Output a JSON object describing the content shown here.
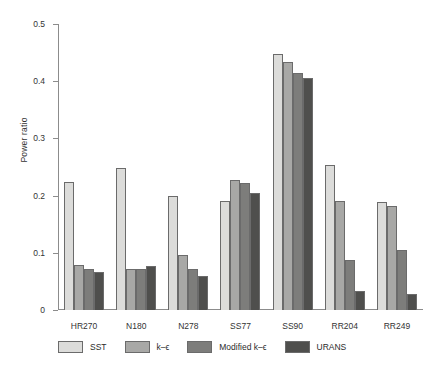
{
  "chart_data": {
    "type": "bar",
    "title": "",
    "xlabel": "",
    "ylabel": "Power ratio",
    "ylim": [
      0,
      0.5
    ],
    "yticks": [
      "0",
      "0.1",
      "0.2",
      "0.3",
      "0.4",
      "0.5"
    ],
    "ytick_values": [
      0,
      0.1,
      0.2,
      0.3,
      0.4,
      0.5
    ],
    "grid": false,
    "legend_position": "bottom",
    "categories": [
      "HR270",
      "N180",
      "N278",
      "SS77",
      "SS90",
      "RR204",
      "RR249"
    ],
    "series": [
      {
        "name": "SST",
        "color": "#dcdcda",
        "values": [
          0.224,
          0.249,
          0.2,
          0.19,
          0.448,
          0.253,
          0.188
        ]
      },
      {
        "name": "k–ϵ",
        "color": "#a8a8a6",
        "values": [
          0.078,
          0.072,
          0.097,
          0.228,
          0.433,
          0.19,
          0.182
        ]
      },
      {
        "name": "Modified k–ϵ",
        "color": "#7d7d7b",
        "values": [
          0.071,
          0.072,
          0.071,
          0.222,
          0.415,
          0.088,
          0.105
        ]
      },
      {
        "name": "URANS",
        "color": "#4f4f4d",
        "values": [
          0.066,
          0.077,
          0.06,
          0.205,
          0.406,
          0.034,
          0.028
        ]
      }
    ]
  },
  "axis": {
    "line_color": "#8c8c8c"
  }
}
